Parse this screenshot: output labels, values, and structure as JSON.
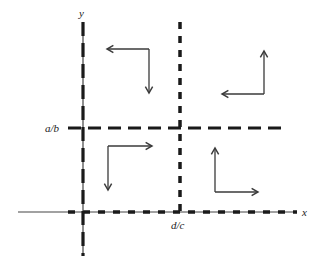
{
  "diagram": {
    "title": "",
    "colors": {
      "background": "#ffffff",
      "ink": "#1a1a1a",
      "axis": "#333333",
      "arrow": "#3a3a3a"
    },
    "axes": {
      "x_label": "x",
      "y_label": "y"
    },
    "lines": {
      "horizontal_nullcline_label": "a/b",
      "vertical_nullcline_label": "d/c"
    },
    "quadrant_arrows": [
      {
        "quadrant": "top-left",
        "directions": [
          "left",
          "down"
        ]
      },
      {
        "quadrant": "top-right",
        "directions": [
          "left",
          "up"
        ]
      },
      {
        "quadrant": "bottom-left",
        "directions": [
          "right",
          "down"
        ]
      },
      {
        "quadrant": "bottom-right",
        "directions": [
          "right",
          "up"
        ]
      }
    ]
  }
}
